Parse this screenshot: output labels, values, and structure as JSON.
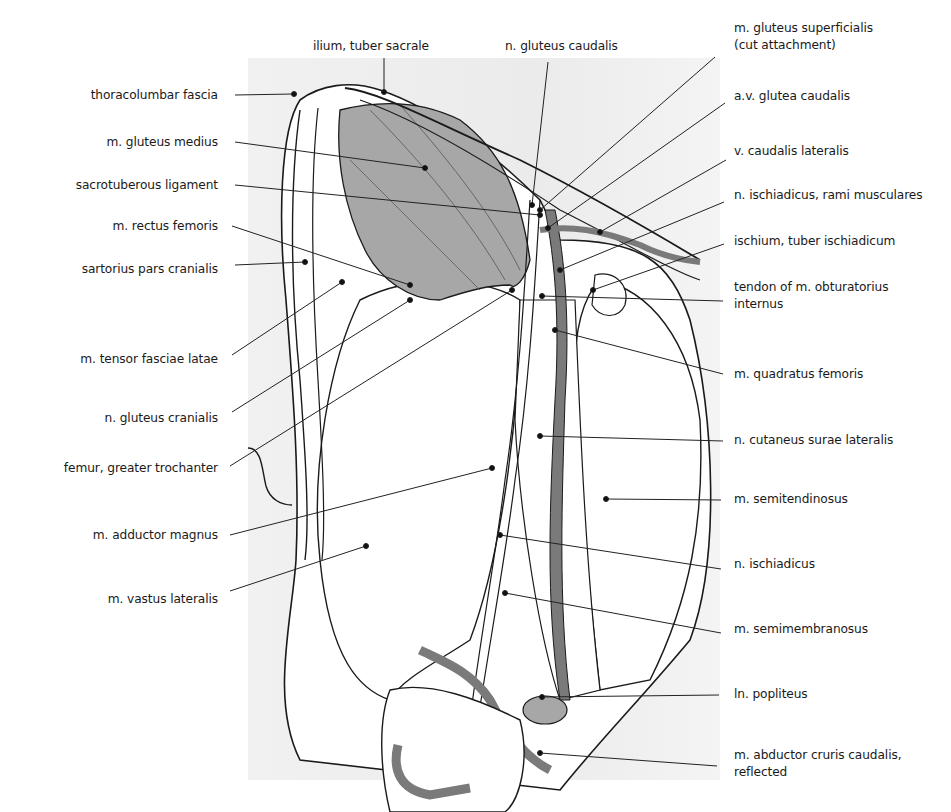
{
  "figure": {
    "colors": {
      "background_panel": "#ececec",
      "muscle_shaded": "#a7a7a7",
      "vessel_dark": "#7a7a7a",
      "outline": "#1a1a1a",
      "leader_line": "#222222"
    }
  },
  "labels": {
    "top": [
      {
        "id": "ilium-tuber-sacrale",
        "text": "ilium, tuber  sacrale"
      },
      {
        "id": "n-gluteus-caudalis",
        "text": "n. gluteus caudalis"
      }
    ],
    "left": [
      {
        "id": "thoracolumbar-fascia",
        "text": "thoracolumbar fascia"
      },
      {
        "id": "m-gluteus-medius",
        "text": "m. gluteus medius"
      },
      {
        "id": "sacrotuberous-ligament",
        "text": "sacrotuberous ligament"
      },
      {
        "id": "m-rectus-femoris",
        "text": "m. rectus femoris"
      },
      {
        "id": "sartorius-pars-cranialis",
        "text": "sartorius pars cranialis"
      },
      {
        "id": "m-tensor-fasciae-latae",
        "text": "m. tensor fasciae latae"
      },
      {
        "id": "n-gluteus-cranialis",
        "text": "n. gluteus cranialis"
      },
      {
        "id": "femur-greater-trochanter",
        "text": "femur,  greater trochanter"
      },
      {
        "id": "m-adductor-magnus",
        "text": "m.  adductor magnus"
      },
      {
        "id": "m-vastus-lateralis",
        "text": "m. vastus lateralis"
      }
    ],
    "right": [
      {
        "id": "m-gluteus-superficialis",
        "line1": "m. gluteus superficialis",
        "line2": "(cut attachment)"
      },
      {
        "id": "av-glutea-caudalis",
        "line1": "a.v. glutea caudalis"
      },
      {
        "id": "v-caudalis-lateralis",
        "line1": "v. caudalis lateralis"
      },
      {
        "id": "n-ischiadicus-rami-musculares",
        "line1": "n. ischiadicus, rami musculares"
      },
      {
        "id": "ischium-tuber-ischiadicum",
        "line1": "ischium, tuber ischiadicum"
      },
      {
        "id": "tendon-obturatorius-internus",
        "line1": "tendon of m. obturatorius",
        "line2": "internus"
      },
      {
        "id": "m-quadratus-femoris",
        "line1": "m. quadratus femoris"
      },
      {
        "id": "n-cutaneus-surae-lateralis",
        "line1": "n. cutaneus surae lateralis"
      },
      {
        "id": "m-semitendinosus",
        "line1": "m. semitendinosus"
      },
      {
        "id": "n-ischiadicus",
        "line1": "n. ischiadicus"
      },
      {
        "id": "m-semimembranosus",
        "line1": "m. semimembranosus"
      },
      {
        "id": "ln-popliteus",
        "line1": "ln. popliteus"
      },
      {
        "id": "m-abductor-cruris-caudalis",
        "line1": "m. abductor cruris caudalis,",
        "line2": "reflected"
      }
    ]
  }
}
